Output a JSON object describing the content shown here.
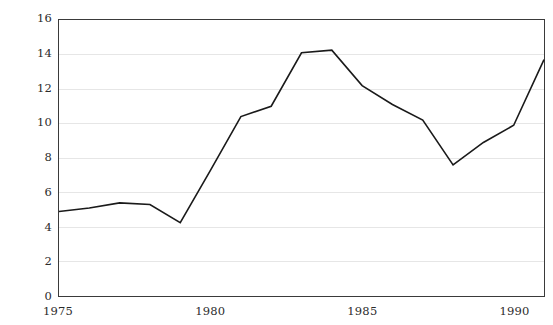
{
  "chart_data": {
    "type": "line",
    "title": "",
    "xlabel": "",
    "ylabel": "",
    "x": [
      1975,
      1976,
      1977,
      1978,
      1979,
      1980,
      1981,
      1982,
      1983,
      1984,
      1985,
      1986,
      1987,
      1988,
      1989,
      1990,
      1991
    ],
    "values": [
      4.9,
      5.1,
      5.4,
      5.3,
      4.25,
      7.3,
      10.4,
      11.0,
      14.1,
      14.25,
      12.2,
      11.1,
      10.2,
      7.6,
      8.9,
      9.9,
      13.7
    ],
    "series": [
      {
        "name": "series-1",
        "values": [
          4.9,
          5.1,
          5.4,
          5.3,
          4.25,
          7.3,
          10.4,
          11.0,
          14.1,
          14.25,
          12.2,
          11.1,
          10.2,
          7.6,
          8.9,
          9.9,
          13.7
        ],
        "color": "#1a1a1a"
      }
    ],
    "xlim": [
      1975,
      1991
    ],
    "ylim": [
      0,
      16
    ],
    "ytick_labels": [
      "0",
      "2",
      "4",
      "6",
      "8",
      "10",
      "12",
      "14",
      "16"
    ],
    "ytick_values": [
      0,
      2,
      4,
      6,
      8,
      10,
      12,
      14,
      16
    ],
    "xtick_labels": [
      "1975",
      "1980",
      "1985",
      "1990"
    ],
    "xtick_values": [
      1975,
      1980,
      1985,
      1990
    ],
    "grid": "horizontal",
    "grid_color": "#e6e6e6",
    "legend": "none",
    "line_color": "#1a1a1a",
    "line_width": 1.6,
    "frame_color": "#3a3a3a",
    "background": "#ffffff",
    "markers": "none"
  },
  "caption": {
    "top_clipped_text": ""
  }
}
